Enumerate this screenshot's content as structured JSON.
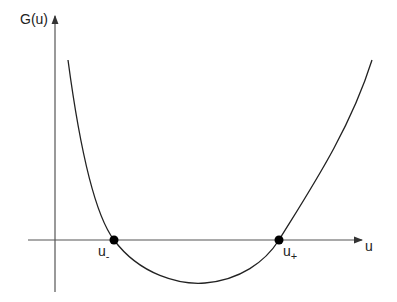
{
  "y_axis_label": "G(u)",
  "x_axis_label": "u",
  "roots": [
    {
      "base": "u",
      "sub": "-"
    },
    {
      "base": "u",
      "sub": "+"
    }
  ],
  "colors": {
    "line": "#222222",
    "axis": "#555555"
  }
}
